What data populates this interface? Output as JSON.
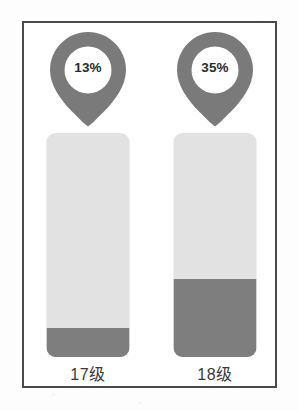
{
  "figure": {
    "frame_border_color": "#4a4a4a",
    "background_color": "#ffffff"
  },
  "chart_data": {
    "type": "bar",
    "title": "",
    "xlabel": "",
    "ylabel": "",
    "ylim": [
      0,
      100
    ],
    "grid": false,
    "legend": "none",
    "categories": [
      "17级",
      "18级"
    ],
    "values": [
      13,
      35
    ],
    "value_labels": [
      "13%",
      "35%"
    ],
    "series": [
      {
        "name": "百分比",
        "values": [
          13,
          35
        ]
      }
    ],
    "marker_style": "map-pin",
    "track_color": "#e2e2e2",
    "fill_color": "#7e7e7e",
    "pin_color": "#7a7a7a",
    "value_text_color": "#2b2b2b"
  },
  "columns": [
    {
      "id": "col-17",
      "pin_value": "13%",
      "percent": 13,
      "label": "17级"
    },
    {
      "id": "col-18",
      "pin_value": "35%",
      "percent": 35,
      "label": "18级"
    }
  ]
}
